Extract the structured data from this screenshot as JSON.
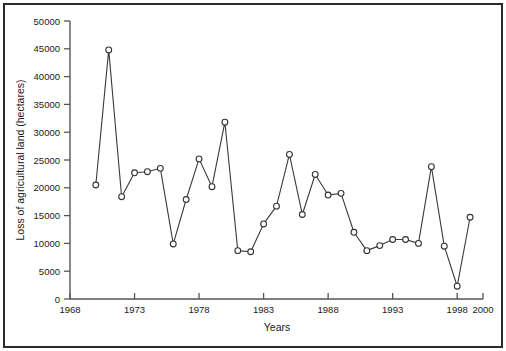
{
  "chart_data": {
    "type": "line",
    "title": "",
    "xlabel": "Years",
    "ylabel": "Loss of agricultural land (hectares)",
    "xlim": [
      1968,
      2000
    ],
    "ylim": [
      0,
      50000
    ],
    "grid": false,
    "legend": null,
    "xticks": [
      1968,
      1973,
      1978,
      1983,
      1988,
      1993,
      1998,
      2000
    ],
    "xtick_labels": [
      "1968",
      "1973",
      "1978",
      "1983",
      "1988",
      "1993",
      "1998",
      "2000"
    ],
    "yticks": [
      0,
      5000,
      10000,
      15000,
      20000,
      25000,
      30000,
      35000,
      40000,
      45000,
      50000
    ],
    "ytick_labels": [
      "0",
      "5000",
      "10000",
      "15000",
      "20000",
      "25000",
      "30000",
      "35000",
      "40000",
      "45000",
      "50000"
    ],
    "marker": "circle-open",
    "line_color": "#3a3a3a",
    "marker_face_color": "#ffffff",
    "marker_edge_color": "#333333",
    "x": [
      1970,
      1971,
      1972,
      1973,
      1974,
      1975,
      1976,
      1977,
      1978,
      1979,
      1980,
      1981,
      1982,
      1983,
      1984,
      1985,
      1986,
      1987,
      1988,
      1989,
      1990,
      1991,
      1992,
      1993,
      1994,
      1995,
      1996,
      1997,
      1998,
      1999
    ],
    "values": [
      20500,
      44800,
      18400,
      22700,
      22900,
      23500,
      9900,
      17900,
      25200,
      20200,
      31800,
      8700,
      8500,
      13500,
      16700,
      26000,
      15200,
      22400,
      18700,
      19000,
      12000,
      8700,
      9600,
      10700,
      10700,
      10000,
      23800,
      9500,
      2300,
      14700
    ],
    "series": [
      {
        "name": "Loss of agricultural land",
        "x": [
          1970,
          1971,
          1972,
          1973,
          1974,
          1975,
          1976,
          1977,
          1978,
          1979,
          1980,
          1981,
          1982,
          1983,
          1984,
          1985,
          1986,
          1987,
          1988,
          1989,
          1990,
          1991,
          1992,
          1993,
          1994,
          1995,
          1996,
          1997,
          1998,
          1999
        ],
        "values": [
          20500,
          44800,
          18400,
          22700,
          22900,
          23500,
          9900,
          17900,
          25200,
          20200,
          31800,
          8700,
          8500,
          13500,
          16700,
          26000,
          15200,
          22400,
          18700,
          19000,
          12000,
          8700,
          9600,
          10700,
          10700,
          10000,
          23800,
          9500,
          2300,
          14700
        ]
      }
    ]
  },
  "axis": {
    "y_title": "Loss of agricultural land (hectares)",
    "x_title": "Years"
  },
  "frame": {
    "border_color": "#2b2b2b",
    "background": "#ffffff"
  }
}
